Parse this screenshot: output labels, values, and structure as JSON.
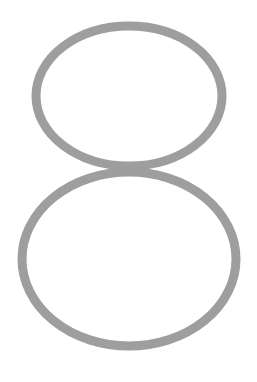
{
  "figure": {
    "glyph": "8",
    "stroke_color": "#9e9e9e",
    "background_color": "#ffffff",
    "upper_loop": {
      "cx": 129,
      "cy": 96,
      "rx": 93,
      "ry": 70
    },
    "lower_loop": {
      "cx": 129,
      "cy": 259,
      "rx": 107,
      "ry": 87
    },
    "stroke_width": 9
  }
}
